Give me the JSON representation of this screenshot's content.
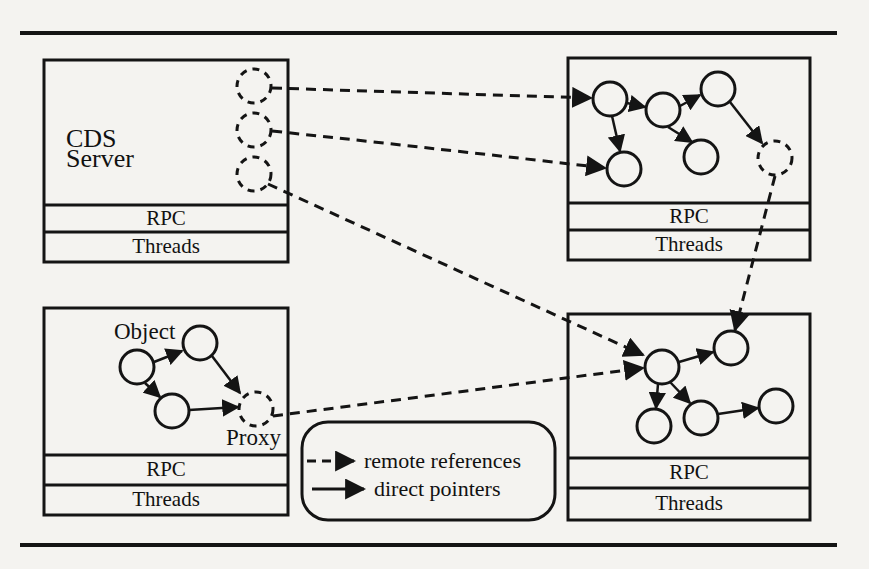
{
  "figure": {
    "colors": {
      "ink": "#141414",
      "paper": "#f4f3f0"
    },
    "boxes": [
      {
        "id": "top-left",
        "title_line1": "CDS",
        "title_line2": "Server",
        "layers": [
          "RPC",
          "Threads"
        ]
      },
      {
        "id": "top-right",
        "layers": [
          "RPC",
          "Threads"
        ]
      },
      {
        "id": "bottom-left",
        "object_label": "Object",
        "proxy_label": "Proxy",
        "layers": [
          "RPC",
          "Threads"
        ]
      },
      {
        "id": "bottom-right",
        "layers": [
          "RPC",
          "Threads"
        ]
      }
    ],
    "legend": {
      "items": [
        {
          "style": "dashed-arrow",
          "label": "remote references"
        },
        {
          "style": "solid-arrow",
          "label": "direct pointers"
        }
      ]
    }
  }
}
